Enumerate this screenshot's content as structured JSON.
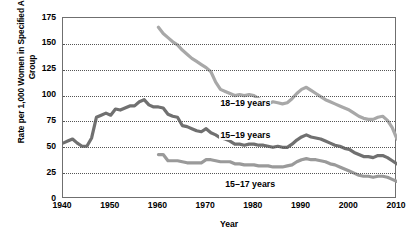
{
  "chart_data": {
    "type": "line",
    "title": "",
    "xlabel": "Year",
    "ylabel": "Rate per 1,000 Women in Specified Age Group",
    "xlim": [
      1940,
      2010
    ],
    "ylim": [
      0,
      175
    ],
    "xticks": [
      1940,
      1950,
      1960,
      1970,
      1980,
      1990,
      2000,
      2010
    ],
    "yticks": [
      0,
      25,
      50,
      75,
      100,
      125,
      150,
      175
    ],
    "grid": "horizontal-dotted",
    "legend_position": "inline-labels",
    "series": [
      {
        "name": "18–19 years",
        "color": "#a8a8a8",
        "label_x": 1973,
        "label_y": 92,
        "x": [
          1960,
          1961,
          1962,
          1963,
          1964,
          1965,
          1966,
          1967,
          1968,
          1969,
          1970,
          1971,
          1972,
          1973,
          1974,
          1975,
          1976,
          1977,
          1978,
          1979,
          1980,
          1981,
          1982,
          1983,
          1984,
          1985,
          1986,
          1987,
          1988,
          1989,
          1990,
          1991,
          1992,
          1993,
          1994,
          1995,
          1996,
          1997,
          1998,
          1999,
          2000,
          2001,
          2002,
          2003,
          2004,
          2005,
          2006,
          2007,
          2008,
          2009,
          2010
        ],
        "y": [
          166.0,
          160.0,
          156.0,
          152.0,
          149.0,
          144.0,
          140.0,
          136.0,
          133.0,
          130.0,
          127.0,
          123.0,
          113.0,
          106.0,
          104.0,
          102.0,
          100.0,
          101.0,
          100.0,
          101.0,
          100.0,
          97.0,
          95.0,
          92.0,
          94.0,
          93.0,
          92.0,
          93.0,
          97.0,
          102.0,
          106.0,
          108.0,
          105.0,
          102.0,
          99.0,
          96.0,
          94.0,
          92.0,
          90.0,
          88.0,
          86.0,
          83.0,
          80.0,
          78.0,
          77.0,
          77.0,
          79.0,
          80.0,
          76.0,
          69.0,
          58.0
        ]
      },
      {
        "name": "15–19 years",
        "color": "#707070",
        "label_x": 1973,
        "label_y": 61,
        "x": [
          1940,
          1941,
          1942,
          1943,
          1944,
          1945,
          1946,
          1947,
          1948,
          1949,
          1950,
          1951,
          1952,
          1953,
          1954,
          1955,
          1956,
          1957,
          1958,
          1959,
          1960,
          1961,
          1962,
          1963,
          1964,
          1965,
          1966,
          1967,
          1968,
          1969,
          1970,
          1971,
          1972,
          1973,
          1974,
          1975,
          1976,
          1977,
          1978,
          1979,
          1980,
          1981,
          1982,
          1983,
          1984,
          1985,
          1986,
          1987,
          1988,
          1989,
          1990,
          1991,
          1992,
          1993,
          1994,
          1995,
          1996,
          1997,
          1998,
          1999,
          2000,
          2001,
          2002,
          2003,
          2004,
          2005,
          2006,
          2007,
          2008,
          2009,
          2010
        ],
        "y": [
          54.0,
          56.0,
          58.0,
          54.0,
          51.0,
          51.0,
          59.0,
          79.0,
          81.0,
          83.0,
          81.0,
          87.0,
          86.0,
          88.0,
          90.0,
          90.0,
          94.0,
          96.0,
          91.0,
          89.0,
          89.0,
          88.0,
          82.0,
          80.0,
          79.0,
          71.0,
          70.0,
          68.0,
          66.0,
          65.0,
          68.0,
          64.0,
          62.0,
          59.0,
          58.0,
          56.0,
          53.0,
          53.0,
          52.0,
          53.0,
          53.0,
          52.0,
          52.0,
          51.0,
          50.0,
          51.0,
          50.0,
          50.0,
          53.0,
          57.0,
          60.0,
          62.0,
          60.0,
          59.0,
          58.0,
          56.0,
          54.0,
          52.0,
          51.0,
          49.0,
          48.0,
          45.0,
          43.0,
          41.0,
          41.0,
          40.0,
          42.0,
          42.0,
          40.0,
          37.0,
          34.0
        ]
      },
      {
        "name": "15–17 years",
        "color": "#9a9a9a",
        "label_x": 1974,
        "label_y": 14,
        "x": [
          1960,
          1961,
          1962,
          1963,
          1964,
          1965,
          1966,
          1967,
          1968,
          1969,
          1970,
          1971,
          1972,
          1973,
          1974,
          1975,
          1976,
          1977,
          1978,
          1979,
          1980,
          1981,
          1982,
          1983,
          1984,
          1985,
          1986,
          1987,
          1988,
          1989,
          1990,
          1991,
          1992,
          1993,
          1994,
          1995,
          1996,
          1997,
          1998,
          1999,
          2000,
          2001,
          2002,
          2003,
          2004,
          2005,
          2006,
          2007,
          2008,
          2009,
          2010
        ],
        "y": [
          43.0,
          43.0,
          37.0,
          37.0,
          37.0,
          36.0,
          35.0,
          35.0,
          35.0,
          35.0,
          38.0,
          38.0,
          37.0,
          36.0,
          36.0,
          36.0,
          34.0,
          34.0,
          33.0,
          33.0,
          33.0,
          32.0,
          32.0,
          32.0,
          31.0,
          31.0,
          31.0,
          32.0,
          33.0,
          36.0,
          38.0,
          39.0,
          38.0,
          38.0,
          37.0,
          36.0,
          34.0,
          33.0,
          31.0,
          29.0,
          27.0,
          25.0,
          23.0,
          22.0,
          22.0,
          21.0,
          22.0,
          22.0,
          21.0,
          19.0,
          17.0
        ]
      }
    ]
  }
}
